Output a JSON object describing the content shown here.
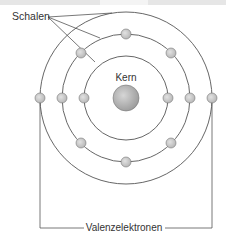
{
  "labels": {
    "shells": "Schalen",
    "nucleus": "Kern",
    "valence": "Valenzelektronen"
  },
  "atom": {
    "center": [
      126,
      98
    ],
    "nucleus_radius": 13,
    "shell_radii": [
      42,
      64,
      86
    ],
    "electrons_per_shell": [
      2,
      8,
      2
    ],
    "colors": {
      "line": "#555555",
      "electron_fill": "#c8c8c8",
      "nucleus_fill": "#b0b0b0"
    }
  }
}
